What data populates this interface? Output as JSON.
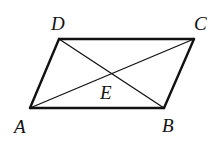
{
  "diagram": {
    "type": "parallelogram-with-diagonals",
    "stroke_color": "#111111",
    "background": "#ffffff",
    "points": {
      "A": {
        "x": 30,
        "y": 108,
        "label": "A",
        "lx": 14,
        "ly": 133
      },
      "B": {
        "x": 164,
        "y": 108,
        "label": "B",
        "lx": 162,
        "ly": 132
      },
      "C": {
        "x": 194,
        "y": 39,
        "label": "C",
        "lx": 194,
        "ly": 30
      },
      "D": {
        "x": 59,
        "y": 39,
        "label": "D",
        "lx": 51,
        "ly": 30
      },
      "E": {
        "x": 111,
        "y": 73,
        "label": "E",
        "lx": 100,
        "ly": 99
      }
    },
    "edges": [
      [
        "A",
        "B"
      ],
      [
        "B",
        "C"
      ],
      [
        "C",
        "D"
      ],
      [
        "D",
        "A"
      ]
    ],
    "diagonals": [
      [
        "A",
        "C"
      ],
      [
        "D",
        "B"
      ]
    ]
  }
}
